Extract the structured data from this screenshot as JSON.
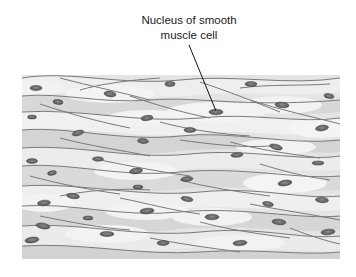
{
  "figure": {
    "label": {
      "line1": "Nucleus of smooth",
      "line2": "muscle cell"
    },
    "leader_line": {
      "from": [
        189,
        45
      ],
      "to": [
        216,
        111
      ]
    },
    "colors": {
      "background": "#ffffff",
      "cytoplasm_light": "#ededed",
      "cytoplasm_mid": "#dcdcdc",
      "cytoplasm_dark": "#cfcfcf",
      "membrane": "#7a7a7a",
      "nucleus": "#5a5a5a",
      "nucleus_highlight": "#8a8a8a",
      "label_text": "#1a1a1a"
    },
    "tissue_bounds": {
      "x": 22,
      "y": 75,
      "width": 318,
      "height": 184
    },
    "nuclei": [
      [
        36,
        88
      ],
      [
        110,
        94
      ],
      [
        170,
        84
      ],
      [
        58,
        102
      ],
      [
        32,
        117
      ],
      [
        147,
        118
      ],
      [
        78,
        133
      ],
      [
        143,
        141
      ],
      [
        32,
        161
      ],
      [
        98,
        159
      ],
      [
        251,
        84
      ],
      [
        329,
        96
      ],
      [
        282,
        105
      ],
      [
        216,
        112
      ],
      [
        190,
        130
      ],
      [
        322,
        128
      ],
      [
        276,
        147
      ],
      [
        237,
        155
      ],
      [
        318,
        163
      ],
      [
        52,
        173
      ],
      [
        136,
        171
      ],
      [
        138,
        187
      ],
      [
        73,
        196
      ],
      [
        44,
        203
      ],
      [
        147,
        211
      ],
      [
        88,
        218
      ],
      [
        43,
        226
      ],
      [
        107,
        234
      ],
      [
        32,
        240
      ],
      [
        163,
        243
      ],
      [
        187,
        179
      ],
      [
        285,
        183
      ],
      [
        187,
        199
      ],
      [
        322,
        200
      ],
      [
        268,
        204
      ],
      [
        212,
        217
      ],
      [
        279,
        222
      ],
      [
        328,
        232
      ],
      [
        240,
        243
      ]
    ]
  }
}
